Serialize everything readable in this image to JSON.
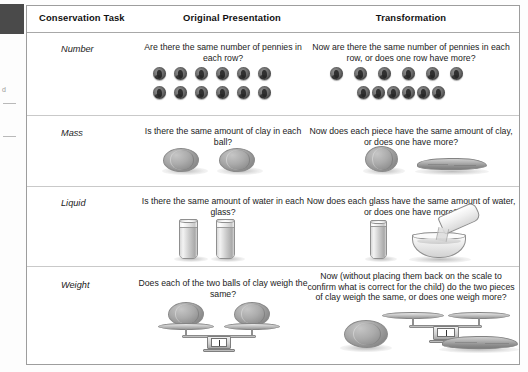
{
  "figure": {
    "columns": [
      {
        "id": "task",
        "label": "Conservation Task"
      },
      {
        "id": "original",
        "label": "Original Presentation"
      },
      {
        "id": "transformation",
        "label": "Transformation"
      }
    ],
    "rows": [
      {
        "task": "Number",
        "original_prompt": "Are there the same number of pennies in each row?",
        "transformation_prompt": "Now are there the same number of pennies in each row, or does one row have more?",
        "original_art": "two-rows-of-six-pennies-evenly-spaced",
        "transformation_art": "two-rows-of-six-pennies-second-row-compressed",
        "penny_count_per_row": 6,
        "row_count": 2
      },
      {
        "task": "Mass",
        "original_prompt": "Is there the same amount of clay in each ball?",
        "transformation_prompt": "Now does each piece have the same amount of clay, or does one have more?",
        "original_art": "two-equal-clay-balls",
        "transformation_art": "one-clay-ball-and-one-flattened-clay-snake"
      },
      {
        "task": "Liquid",
        "original_prompt": "Is there the same amount of water in each glass?",
        "transformation_prompt": "Now does each glass have the same amount of water, or does one have more?",
        "original_art": "two-identical-tall-glasses-of-water",
        "transformation_art": "tall-glass-and-water-poured-into-wide-bowl"
      },
      {
        "task": "Weight",
        "original_prompt": "Does each of the two balls of clay weigh the same?",
        "transformation_prompt": "Now (without placing them back on the scale to confirm what is correct for the child) do the two pieces of clay weigh the same, or does one weigh more?",
        "original_art": "balance-scale-with-two-equal-clay-balls",
        "transformation_art": "empty-balance-scale-with-clay-ball-and-flattened-snake-beside-it"
      }
    ]
  },
  "scan_artifacts": {
    "corner_block": "dark-scan-block",
    "margin_marks": [
      "d",
      "—",
      "—"
    ]
  }
}
